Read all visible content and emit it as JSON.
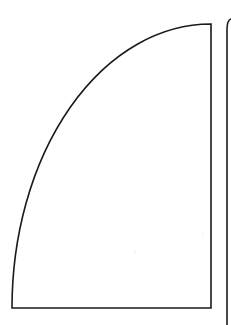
{
  "canvas": {
    "width": 231,
    "height": 325,
    "background_color": "#ffffff",
    "title": "Quarter-Ellipse Line Drawing"
  },
  "style": {
    "stroke_color": "#1a1a1a",
    "stroke_width": 1.6,
    "fill": "none"
  },
  "figures": [
    {
      "name": "main-quarter-ellipse-shape",
      "description": "Closed sail-like figure: vertical right edge, horizontal bottom edge, and a concave elliptical arc joining the bottom-left corner to the top-right apex",
      "apex": {
        "x": 211,
        "y": 24
      },
      "bottom_right_corner": {
        "x": 211,
        "y": 308
      },
      "bottom_left_corner": {
        "x": 12,
        "y": 308
      },
      "arc_radius_x": 199,
      "arc_radius_y": 284,
      "path": "M 211 24 L 211 308 L 12 308 A 199 284 0 0 1 211 24 Z"
    },
    {
      "name": "secondary-clipped-shape",
      "description": "Partial second figure at the right edge: rounded top-left corner opening into a vertical line that runs off the bottom of the frame, clipped by the image border",
      "corner_start": {
        "x": 231,
        "y": 19
      },
      "corner_end": {
        "x": 227,
        "y": 34
      },
      "corner_radius": 5,
      "bottom": {
        "x": 227,
        "y": 325
      },
      "path": "M 231 19 L 232 19 M 231 19 Q 227 20 227 30 L 227 325"
    }
  ],
  "specks": [
    {
      "x": 202,
      "y": 232,
      "w": 1,
      "h": 5
    },
    {
      "x": 134,
      "y": 250,
      "w": 2,
      "h": 3
    },
    {
      "x": 27,
      "y": 78,
      "w": 1,
      "h": 1
    }
  ]
}
